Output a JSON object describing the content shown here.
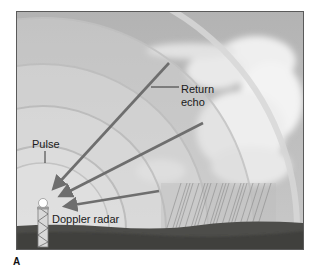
{
  "figure": {
    "panel_label": "A",
    "labels": {
      "return_echo_line1": "Return",
      "return_echo_line2": "echo",
      "pulse": "Pulse",
      "radar": "Doppler radar"
    },
    "elements": {
      "pulse_rings": 5,
      "return_arrows": 3,
      "objects": [
        "doppler-radar-tower",
        "storm-cloud",
        "rain-shaft",
        "ground"
      ]
    },
    "colors": {
      "sky": "#b9b9b9",
      "ring_light": "#dcdcdc",
      "ring_dark": "#c4c4c4",
      "arrow": "#6e6e6e",
      "ground": "#4a4a47",
      "cloud": "#f2f2f2",
      "text": "#1a1a1a"
    }
  }
}
